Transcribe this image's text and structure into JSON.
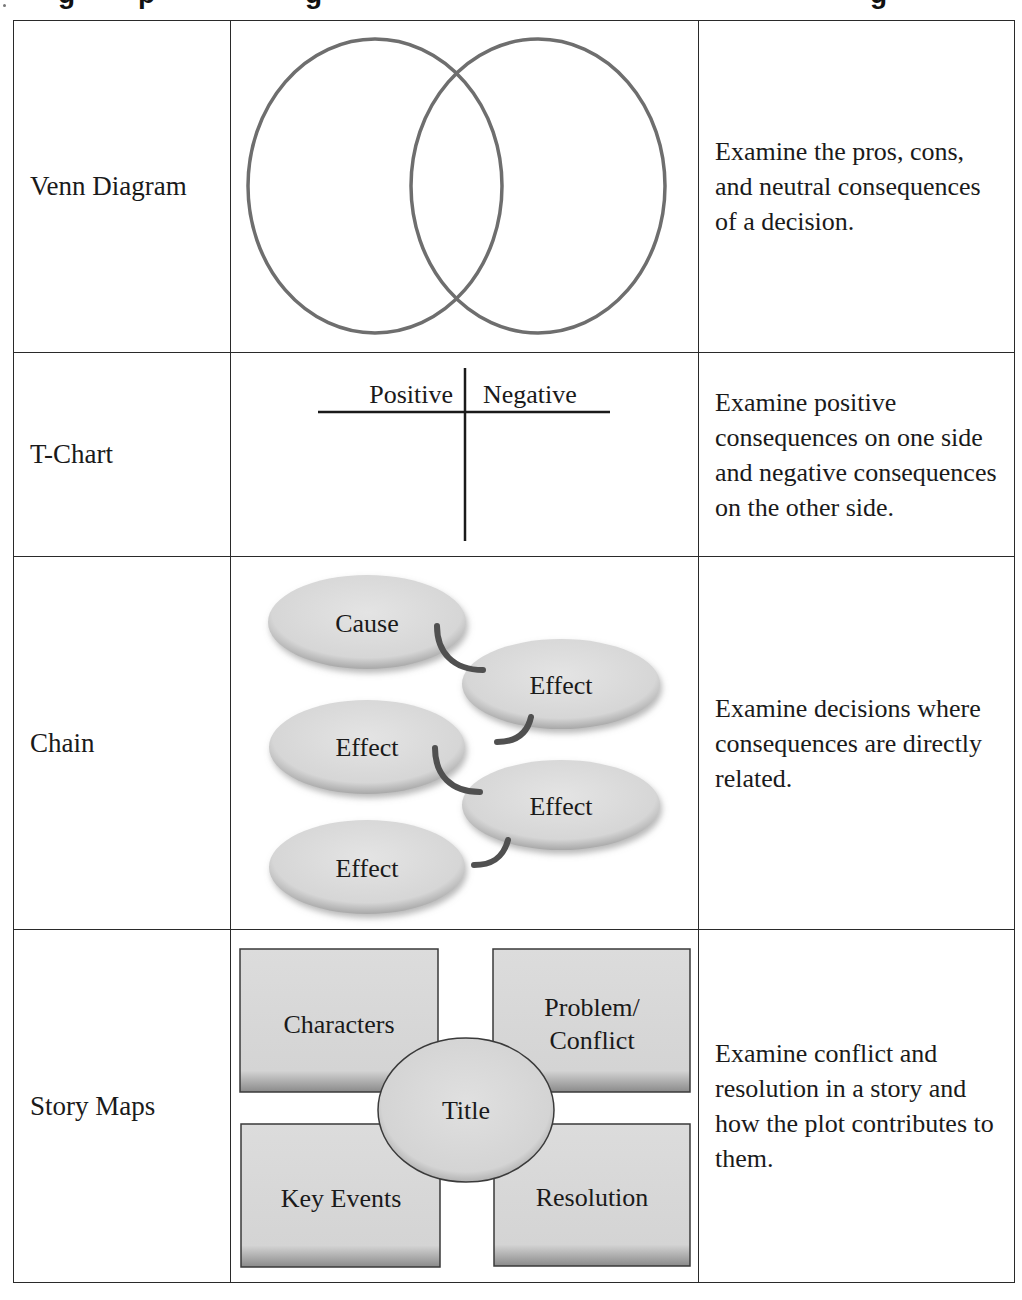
{
  "page": {
    "title_fragment": [
      "g",
      "p",
      "g",
      "g"
    ]
  },
  "table": {
    "rows": [
      {
        "name": "Venn Diagram",
        "visual": "venn",
        "description": "Examine the pros, cons, and neutral consequences of a decision."
      },
      {
        "name": "T-Chart",
        "visual": "t-chart",
        "t_chart": {
          "left_header": "Positive",
          "right_header": "Negative"
        },
        "description": "Examine positive consequences on one side and negative consequences on the other side."
      },
      {
        "name": "Chain",
        "visual": "chain",
        "chain": {
          "nodes": [
            "Cause",
            "Effect",
            "Effect",
            "Effect",
            "Effect"
          ]
        },
        "description": "Examine decisions where consequences are directly related."
      },
      {
        "name": "Story Maps",
        "visual": "story-map",
        "story_map": {
          "boxes": [
            "Characters",
            "Problem/",
            "Conflict",
            "Key Events",
            "Resolution"
          ],
          "center": "Title"
        },
        "description": "Examine conflict and resolution in a story and how the plot contributes to them."
      }
    ]
  },
  "colors": {
    "border": "#2a2a2a",
    "venn_stroke": "#6e6e6e",
    "shape_fill": "#dcdcdc",
    "connector": "#505050"
  }
}
